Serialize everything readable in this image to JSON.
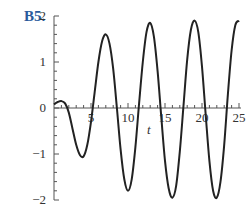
{
  "problem_label": "B5.",
  "chart_data": {
    "type": "line",
    "title": "",
    "xlabel": "t",
    "ylabel": "",
    "xlim": [
      0,
      25
    ],
    "ylim": [
      -2,
      2
    ],
    "x_ticks": [
      5,
      10,
      15,
      20,
      25
    ],
    "y_ticks": [
      -2,
      -1,
      0,
      1,
      2
    ],
    "grid": false,
    "legend": null,
    "series": [
      {
        "name": "solution curve",
        "x": [
          0,
          0.5,
          1,
          1.5,
          2,
          2.5,
          3,
          3.5,
          4,
          4.5,
          5,
          5.5,
          6,
          6.5,
          7,
          7.5,
          8,
          8.5,
          9,
          9.5,
          10,
          10.5,
          11,
          11.5,
          12,
          12.5,
          13,
          13.5,
          14,
          14.5,
          15,
          15.5,
          16,
          16.5,
          17,
          17.5,
          18,
          18.5,
          19,
          19.5,
          20,
          20.5,
          21,
          21.5,
          22,
          22.5,
          23,
          23.5,
          24,
          24.5,
          25
        ],
        "y": [
          0.08,
          0.13,
          0.15,
          0.1,
          -0.1,
          -0.45,
          -0.8,
          -1.02,
          -1.05,
          -0.8,
          -0.3,
          0.35,
          1.0,
          1.45,
          1.6,
          1.4,
          0.85,
          0.0,
          -0.9,
          -1.55,
          -1.8,
          -1.55,
          -0.85,
          0.1,
          1.0,
          1.65,
          1.85,
          1.55,
          0.8,
          -0.2,
          -1.15,
          -1.75,
          -1.95,
          -1.7,
          -0.95,
          0.05,
          1.05,
          1.7,
          1.9,
          1.65,
          0.9,
          -0.15,
          -1.15,
          -1.8,
          -1.95,
          -1.6,
          -0.8,
          0.3,
          1.25,
          1.8,
          1.9
        ]
      }
    ]
  }
}
